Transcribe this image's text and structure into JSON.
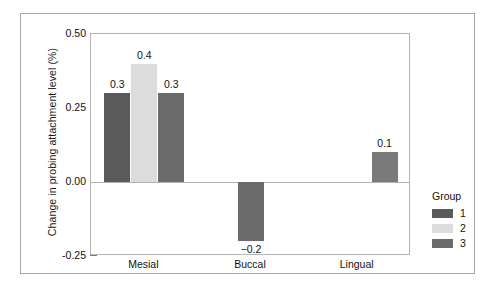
{
  "chart_data": {
    "type": "bar",
    "title": "",
    "subtitle": "",
    "xlabel": "",
    "ylabel": "Change in probing attachment level (%)",
    "categories": [
      "Mesial",
      "Buccal",
      "Lingual"
    ],
    "series": [
      {
        "name": "1",
        "color": "#5a5a5a",
        "values": [
          0.3,
          -0.2,
          0.1
        ]
      },
      {
        "name": "2",
        "color": "#dcdcdc",
        "values": [
          0.4,
          null,
          null
        ]
      },
      {
        "name": "3",
        "color": "#6b6b6b",
        "values": [
          0.3,
          null,
          null
        ]
      }
    ],
    "bars": [
      {
        "category": "Mesial",
        "group": "1",
        "value": 0.3,
        "label": "0.3",
        "color": "#5a5a5a"
      },
      {
        "category": "Mesial",
        "group": "2",
        "value": 0.4,
        "label": "0.4",
        "color": "#dcdcdc"
      },
      {
        "category": "Mesial",
        "group": "3",
        "value": 0.3,
        "label": "0.3",
        "color": "#6b6b6b"
      },
      {
        "category": "Buccal",
        "group": "2",
        "value": -0.2,
        "label": "−0.2",
        "color": "#6b6b6b"
      },
      {
        "category": "Lingual",
        "group": "3",
        "value": 0.1,
        "label": "0.1",
        "color": "#7a7a7a"
      }
    ],
    "ylim": [
      -0.25,
      0.5
    ],
    "y_major_ticks": [
      "0.50",
      "0.25",
      "0.00",
      "-0.25"
    ],
    "y_major_values": [
      0.5,
      0.25,
      0.0,
      -0.25
    ],
    "y_minor_step": 0.05,
    "grid": false,
    "zero_line": true,
    "legend": {
      "title": "Group",
      "position": "right",
      "entries": [
        {
          "label": "1",
          "color": "#5a5a5a"
        },
        {
          "label": "2",
          "color": "#dcdcdc"
        },
        {
          "label": "3",
          "color": "#6b6b6b"
        }
      ]
    }
  },
  "axis": {
    "y_title": "Change in probing attachment level (%)",
    "y_ticks": [
      {
        "text": "0.50",
        "value": 0.5
      },
      {
        "text": "0.25",
        "value": 0.25
      },
      {
        "text": "0.00",
        "value": 0.0
      },
      {
        "text": "-0.25",
        "value": -0.25
      }
    ],
    "x_ticks": [
      {
        "text": "Mesial"
      },
      {
        "text": "Buccal"
      },
      {
        "text": "Lingual"
      }
    ]
  },
  "legend": {
    "title": "Group",
    "items": [
      {
        "label": "1",
        "color": "#5a5a5a"
      },
      {
        "label": "2",
        "color": "#dcdcdc"
      },
      {
        "label": "3",
        "color": "#6b6b6b"
      }
    ]
  },
  "bar_labels": {
    "mesial_1": "0.3",
    "mesial_2": "0.4",
    "mesial_3": "0.3",
    "buccal": "−0.2",
    "lingual": "0.1"
  }
}
